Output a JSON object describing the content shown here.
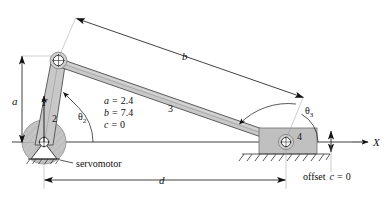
{
  "figure": {
    "colors": {
      "link_fill": "#c8c8c8",
      "link_stroke": "#555555",
      "outline": "#222222",
      "motor_fill": "#c4c4c4",
      "slider_fill": "#c0c0c0",
      "line": "#111111",
      "background": "#ffffff"
    }
  },
  "links": {
    "crank_label": "2",
    "coupler_label": "3",
    "slider_label": "4"
  },
  "angles": {
    "theta2": "θ",
    "theta2_sub": "2",
    "theta3": "θ",
    "theta3_sub": "3"
  },
  "axes": {
    "x_label": "X",
    "y_label": "Y"
  },
  "dimensions": {
    "a_label": "a",
    "b_label": "b",
    "d_label": "d"
  },
  "parameters": [
    {
      "name": "a",
      "eq": "=",
      "value": "2.4"
    },
    {
      "name": "b",
      "eq": "=",
      "value": "7.4"
    },
    {
      "name": "c",
      "eq": "=",
      "value": "0"
    }
  ],
  "annotations": {
    "servomotor": "servomotor",
    "offset_prefix": "offset",
    "offset_var": "c",
    "offset_eq": "=",
    "offset_value": "0"
  }
}
